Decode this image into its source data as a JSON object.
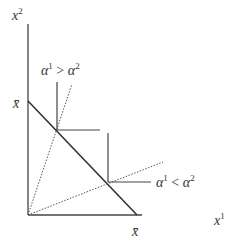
{
  "axes": {
    "x_label": "x",
    "x_sup": "1",
    "y_label": "x",
    "y_sup": "2",
    "x_intercept_label": "x̄",
    "y_intercept_label": "x̄"
  },
  "annotations": {
    "upper": {
      "a": "α",
      "a_sup": "1",
      "op": " > ",
      "b": "α",
      "b_sup": "2"
    },
    "lower": {
      "a": "α",
      "a_sup": "1",
      "op": " < ",
      "b": "α",
      "b_sup": "2"
    }
  },
  "colors": {
    "line": "#333333",
    "dotted": "#555555"
  }
}
